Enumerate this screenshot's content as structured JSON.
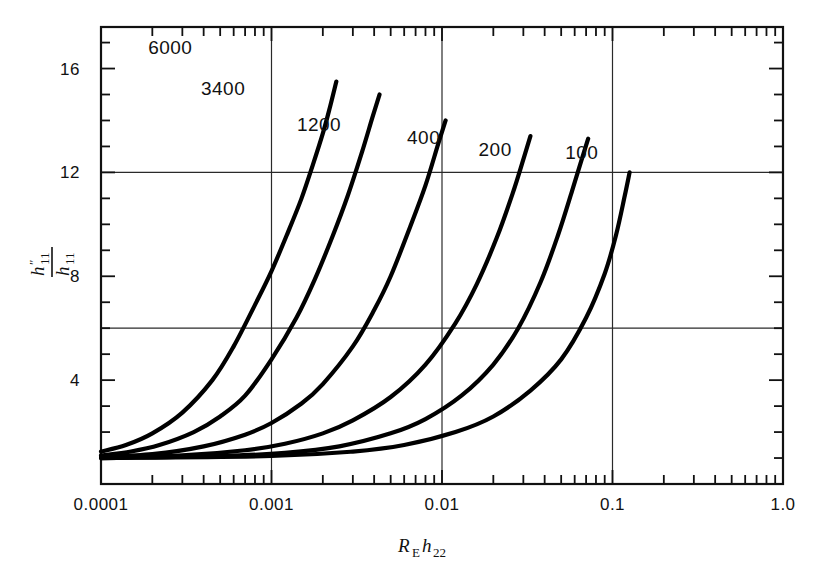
{
  "chart_data": {
    "type": "line",
    "title": "",
    "xlabel": "R_E h_22",
    "ylabel": "h''_11 / h_11",
    "xscale": "log",
    "xlim": [
      0.0001,
      1.0
    ],
    "ylim": [
      0,
      17.6
    ],
    "grid": "major decade verticals at 0.001, 0.01, 0.1 and horizontals at 6 and 12",
    "legend_position": "inline curve labels",
    "x_tick_labels": [
      "0.0001",
      "0.001",
      "0.01",
      "0.1",
      "1.0"
    ],
    "x_tick_values": [
      0.0001,
      0.001,
      0.01,
      0.1,
      1.0
    ],
    "y_tick_labels": [
      "4",
      "8",
      "12",
      "16"
    ],
    "y_tick_values": [
      4,
      8,
      12,
      16
    ],
    "y_minor_step": 1,
    "series": [
      {
        "name": "6000",
        "label": "6000",
        "label_x": 0.000255,
        "label_y": 16.55,
        "x": [
          0.0001,
          0.00014,
          0.0002,
          0.0003,
          0.00045,
          0.0006,
          0.0008,
          0.001,
          0.00125,
          0.0015,
          0.00175,
          0.002,
          0.0022,
          0.0024
        ],
        "y": [
          1.25,
          1.5,
          1.95,
          2.75,
          4.0,
          5.3,
          6.9,
          8.2,
          9.7,
          11.0,
          12.3,
          13.5,
          14.5,
          15.5
        ]
      },
      {
        "name": "3400",
        "label": "3400",
        "label_x": 0.00052,
        "label_y": 15.0,
        "x": [
          0.0001,
          0.00015,
          0.00022,
          0.00035,
          0.0005,
          0.0007,
          0.001,
          0.0014,
          0.0018,
          0.0023,
          0.0028,
          0.0034,
          0.0039,
          0.0043
        ],
        "y": [
          1.1,
          1.25,
          1.5,
          2.0,
          2.6,
          3.4,
          4.8,
          6.4,
          7.9,
          9.6,
          11.1,
          12.8,
          14.1,
          15.0
        ]
      },
      {
        "name": "1200",
        "label": "1200",
        "label_x": 0.0019,
        "label_y": 13.6,
        "x": [
          0.0001,
          0.0002,
          0.0004,
          0.0007,
          0.001,
          0.0015,
          0.002,
          0.003,
          0.004,
          0.005,
          0.0065,
          0.008,
          0.0095,
          0.0105
        ],
        "y": [
          1.05,
          1.15,
          1.45,
          1.9,
          2.35,
          3.1,
          3.85,
          5.3,
          6.7,
          8.0,
          9.9,
          11.5,
          13.1,
          14.0
        ]
      },
      {
        "name": "400",
        "label": "400",
        "label_x": 0.0078,
        "label_y": 13.1,
        "x": [
          0.0001,
          0.0003,
          0.0007,
          0.0012,
          0.002,
          0.003,
          0.005,
          0.008,
          0.012,
          0.016,
          0.021,
          0.026,
          0.03,
          0.033
        ],
        "y": [
          1.02,
          1.1,
          1.3,
          1.55,
          1.95,
          2.45,
          3.35,
          4.6,
          6.2,
          7.7,
          9.5,
          11.2,
          12.5,
          13.4
        ]
      },
      {
        "name": "200",
        "label": "200",
        "label_x": 0.0205,
        "label_y": 12.65,
        "x": [
          0.0001,
          0.0005,
          0.0012,
          0.0025,
          0.005,
          0.008,
          0.013,
          0.02,
          0.028,
          0.038,
          0.048,
          0.058,
          0.066,
          0.072
        ],
        "y": [
          1.0,
          1.08,
          1.2,
          1.45,
          1.95,
          2.5,
          3.4,
          4.6,
          6.0,
          7.8,
          9.6,
          11.3,
          12.5,
          13.3
        ]
      },
      {
        "name": "100",
        "label": "100",
        "label_x": 0.066,
        "label_y": 12.5,
        "x": [
          0.0001,
          0.001,
          0.003,
          0.006,
          0.012,
          0.02,
          0.033,
          0.05,
          0.07,
          0.09,
          0.105,
          0.118,
          0.126
        ],
        "y": [
          1.0,
          1.08,
          1.25,
          1.5,
          2.0,
          2.6,
          3.6,
          4.8,
          6.4,
          8.1,
          9.6,
          11.1,
          12.0
        ]
      }
    ]
  },
  "axes": {
    "y_label_numerator": "h",
    "y_label_numerator_sup": "″",
    "y_label_numerator_sub": "11",
    "y_label_denominator": "h",
    "y_label_denominator_sub": "11",
    "x_label_main": "R",
    "x_label_main_sub": "E",
    "x_label_second": "h",
    "x_label_second_sub": "22"
  },
  "style": {
    "axis_color": "#111111",
    "grid_color": "#2a2a2a",
    "curve_color": "#000000",
    "background": "#ffffff"
  }
}
